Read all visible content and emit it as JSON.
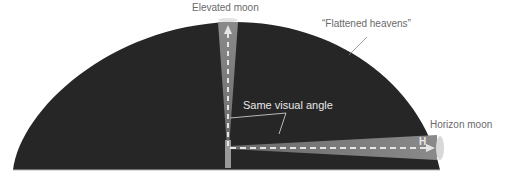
{
  "labels": {
    "elevated_moon": "Elevated moon",
    "flattened_heavens": "“Flattened heavens”",
    "same_visual_angle": "Same visual angle",
    "horizon_moon": "Horizon moon",
    "h_marker": "H"
  },
  "colors": {
    "dome": "#262626",
    "beam": "#777777",
    "arrow": "#e6e6e6",
    "label": "#6a6a6a"
  }
}
